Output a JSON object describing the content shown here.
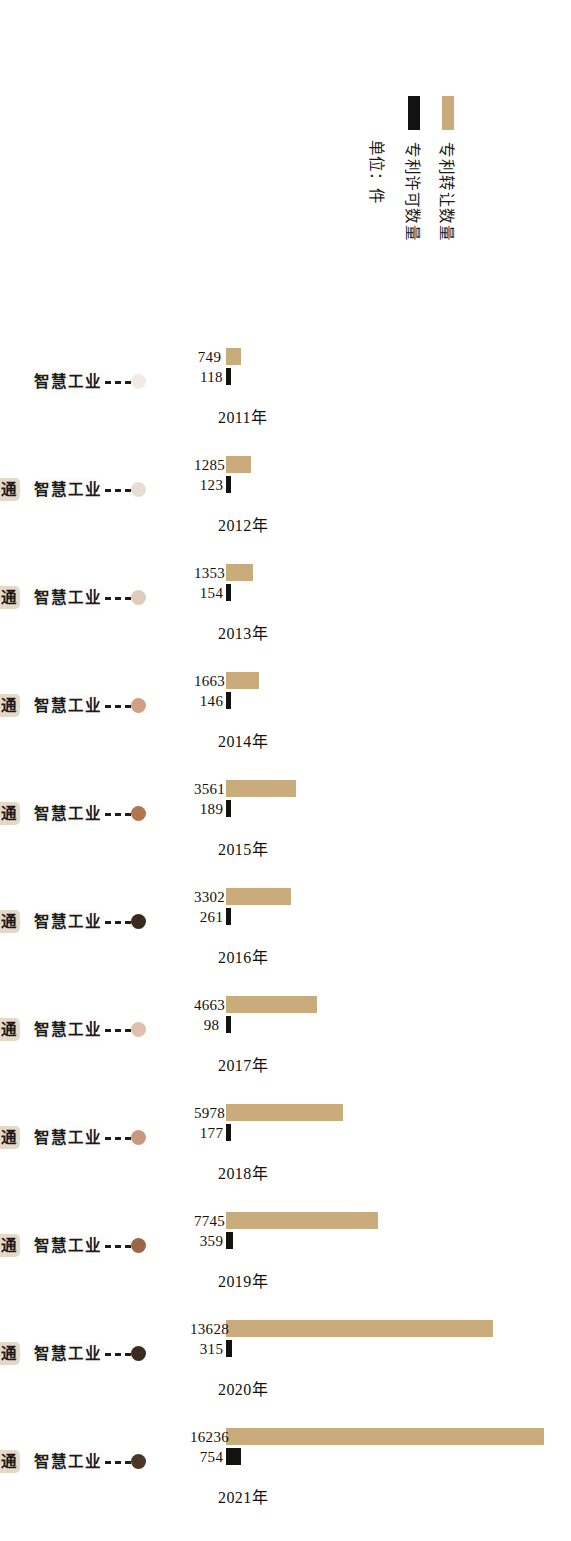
{
  "legend": {
    "items": [
      {
        "label": "专利转让数量",
        "color": "#c9ab7c"
      },
      {
        "label": "专利许可数量",
        "color": "#141210"
      }
    ],
    "unit": "单位：件"
  },
  "chart_data": {
    "type": "bar",
    "title": "",
    "subtitle": "",
    "xlabel": "",
    "ylabel": "",
    "unit": "件",
    "orientation": "rotated-90",
    "grid": false,
    "legend_position": "left",
    "categories": [
      "2011年",
      "2012年",
      "2013年",
      "2014年",
      "2015年",
      "2016年",
      "2017年",
      "2018年",
      "2019年",
      "2020年",
      "2021年"
    ],
    "ylim": [
      0,
      16236
    ],
    "series": [
      {
        "name": "专利转让数量",
        "color": "#c9ab7c",
        "values": [
          749,
          1285,
          1353,
          1663,
          3561,
          3302,
          4663,
          5978,
          7745,
          13628,
          16236
        ]
      },
      {
        "name": "专利许可数量",
        "color": "#141210",
        "values": [
          118,
          123,
          154,
          146,
          189,
          261,
          98,
          177,
          359,
          315,
          754
        ]
      }
    ],
    "annotations": {
      "timeline_dot_colors": [
        "#f2ebe3",
        "#e8ddd2",
        "#dfcbbb",
        "#cfa184",
        "#b4apply",
        "#3a2a20",
        "#e0bfae",
        "#c79a80",
        "#9a6849",
        "#3b2b21",
        "#4a3527"
      ],
      "tag_rows": [
        {
          "label": "智慧工业",
          "bg": "#fbfaf8",
          "fg": "#1a1a1a",
          "years": [
            "2011年",
            "2012年",
            "2013年",
            "2014年",
            "2015年",
            "2016年",
            "2017年",
            "2018年",
            "2019年",
            "2020年",
            "2021年"
          ]
        },
        {
          "label": "智慧交通",
          "bg": "#e4d8c6",
          "fg": "#1a1a1a",
          "years": [
            "2012年",
            "2013年",
            "2014年",
            "2015年",
            "2016年",
            "2017年",
            "2018年",
            "2019年",
            "2020年",
            "2021年"
          ]
        },
        {
          "label": "智慧城市",
          "bg": "#c9a193",
          "fg": "#1a1a1a",
          "years": [
            "2014年",
            "2015年",
            "2016年",
            "2017年",
            "2018年",
            "2019年",
            "2020年",
            "2021年"
          ]
        },
        {
          "label": "智慧医疗",
          "bg": "#c29887",
          "fg": "#1a1a1a",
          "years": [
            "2015年",
            "2016年",
            "2017年",
            "2018年",
            "2019年",
            "2020年",
            "2021年"
          ]
        },
        {
          "label": "智慧金融",
          "bg": "#ab8573",
          "fg": "#efe6dd",
          "years": [
            "2016年",
            "2017年",
            "2018年",
            "2019年",
            "2020年",
            "2021年"
          ]
        },
        {
          "label": "智慧工业",
          "bg": "#7a5340",
          "fg": "#f1e8e0",
          "years": [
            "2017年",
            "2018年",
            "2019年",
            "2020年",
            "2021年"
          ]
        },
        {
          "label": "智慧农业",
          "bg": "#4a3226",
          "fg": "#efe4da",
          "years": [
            "2019年",
            "2020年",
            "2021年"
          ]
        }
      ]
    }
  }
}
